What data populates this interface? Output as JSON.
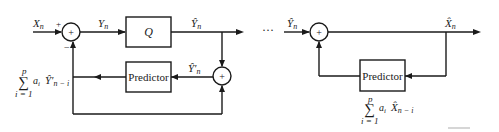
{
  "diagram": {
    "type": "DPCM encoder/decoder block diagram",
    "encoder": {
      "input_label": "X",
      "input_sub": "n",
      "summer_plus": "+",
      "summer_minus": "−",
      "summer_symbol": "+",
      "summer_output_label": "Y",
      "summer_output_sub": "n",
      "quantizer_label": "Q",
      "quantizer_output_label": "Ŷ",
      "quantizer_output_sub": "n",
      "reconstruct_summer_symbol": "+",
      "reconstructed_label": "Ŷ′",
      "reconstructed_sub": "n",
      "predictor_label": "Predictor",
      "prediction_sum": "∑",
      "prediction_upper": "p",
      "prediction_lower": "i = 1",
      "prediction_coef": "a",
      "prediction_coef_sub": "i",
      "prediction_term": "Ŷ′",
      "prediction_term_sub": "n − i"
    },
    "ellipsis": "···",
    "decoder": {
      "input_label": "Ŷ",
      "input_sub": "n",
      "summer_symbol": "+",
      "output_label": "X̂",
      "output_sub": "n",
      "predictor_label": "Predictor",
      "prediction_sum": "∑",
      "prediction_upper": "p",
      "prediction_lower": "i = 1",
      "prediction_coef": "a",
      "prediction_coef_sub": "i",
      "prediction_term": "X̂",
      "prediction_term_sub": "n − i"
    }
  }
}
